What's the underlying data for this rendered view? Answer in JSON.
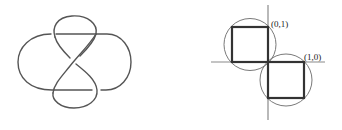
{
  "figures": [
    {
      "id": "knot",
      "description": "Knot diagram: figure-eight style closed curve with two side lobes and central crossing",
      "stroke_color": "#555555"
    },
    {
      "id": "lattice",
      "description": "Coordinate axes with two unit squares inscribed in circles, touching at the origin",
      "labels": {
        "point_a": "(0,1)",
        "point_b": "(1,0)"
      },
      "axis_color": "#8a8a8a",
      "square_color": "#333333",
      "circle_color": "#6a6a6a"
    }
  ]
}
